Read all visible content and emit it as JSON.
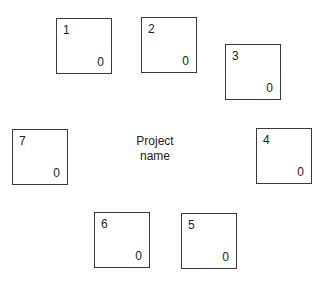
{
  "center_label": {
    "line1": "Project",
    "line2": "name"
  },
  "boxes": [
    {
      "number": "1",
      "count": "0",
      "x": 56,
      "y": 18
    },
    {
      "number": "2",
      "count": "0",
      "x": 141,
      "y": 17
    },
    {
      "number": "3",
      "count": "0",
      "x": 225,
      "y": 44
    },
    {
      "number": "4",
      "count": "0",
      "x": 256,
      "y": 128
    },
    {
      "number": "5",
      "count": "0",
      "x": 181,
      "y": 213
    },
    {
      "number": "6",
      "count": "0",
      "x": 94,
      "y": 212
    },
    {
      "number": "7",
      "count": "0",
      "x": 12,
      "y": 129
    }
  ]
}
